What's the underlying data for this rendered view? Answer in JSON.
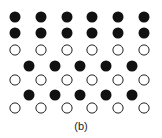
{
  "figure": {
    "caption": "(b)",
    "colors": {
      "filled": "#111111",
      "open_fill": "#ffffff",
      "open_stroke": "#222222"
    },
    "atom_radius": 5.5,
    "rows": [
      {
        "type": "filled",
        "y": 17,
        "x": [
          15,
          41,
          67,
          92,
          118,
          144
        ]
      },
      {
        "type": "filled",
        "y": 33,
        "x": [
          15,
          41,
          67,
          92,
          118,
          144
        ]
      },
      {
        "type": "open",
        "y": 50,
        "x": [
          15,
          41,
          67,
          92,
          118,
          144
        ]
      },
      {
        "type": "filled",
        "y": 66,
        "x": [
          29,
          55,
          80,
          106,
          132
        ]
      },
      {
        "type": "open",
        "y": 80,
        "x": [
          15,
          41,
          67,
          92,
          118,
          144
        ]
      },
      {
        "type": "filled",
        "y": 95,
        "x": [
          29,
          55,
          80,
          106,
          132
        ]
      },
      {
        "type": "open",
        "y": 108,
        "x": [
          15,
          41,
          67,
          92,
          118,
          144
        ]
      }
    ]
  }
}
